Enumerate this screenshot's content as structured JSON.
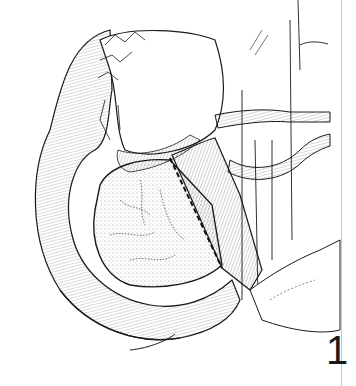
{
  "figure": {
    "number": "1",
    "colors": {
      "ink": "#1a1a1a",
      "background": "#ffffff",
      "border": "#c8c8c8"
    }
  }
}
